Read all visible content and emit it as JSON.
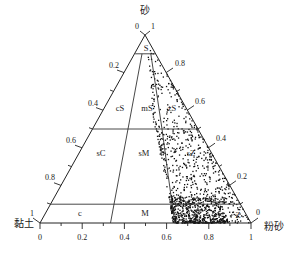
{
  "diagram": {
    "type": "ternary-classification",
    "corners": {
      "top": {
        "label": "砂",
        "label_left": "0",
        "label_right": "1"
      },
      "left": {
        "label": "黏土",
        "tick_label": "1"
      },
      "right": {
        "label": "粉砂",
        "tick_label": "0"
      }
    },
    "base_axis": {
      "ticks": [
        "0",
        "0.2",
        "0.4",
        "0.6",
        "0.8",
        "1"
      ]
    },
    "left_axis": {
      "ticks": [
        "0.2",
        "0.4",
        "0.6",
        "0.8"
      ]
    },
    "right_axis": {
      "ticks": [
        "0.8",
        "0.6",
        "0.4",
        "0.2"
      ]
    },
    "regions": [
      {
        "id": "S",
        "label": "S"
      },
      {
        "id": "cS",
        "label": "cS"
      },
      {
        "id": "mS",
        "label": "mS"
      },
      {
        "id": "zS",
        "label": "zS"
      },
      {
        "id": "sC",
        "label": "sC"
      },
      {
        "id": "sM",
        "label": "sM"
      },
      {
        "id": "sZ",
        "label": "sZ"
      },
      {
        "id": "c",
        "label": "c"
      },
      {
        "id": "M",
        "label": "M"
      },
      {
        "id": "Z",
        "label": "Z"
      }
    ],
    "boundaries": {
      "sand_levels": [
        0.9,
        0.5,
        0.1
      ],
      "silt_ratio_base": [
        0.333,
        0.636
      ]
    },
    "points": {
      "color": "#111111",
      "description": "Scattered sample points concentrated in zS, sZ and Z/M regions; dense cluster near base between silt ratio 0.63 and 0.9"
    }
  }
}
